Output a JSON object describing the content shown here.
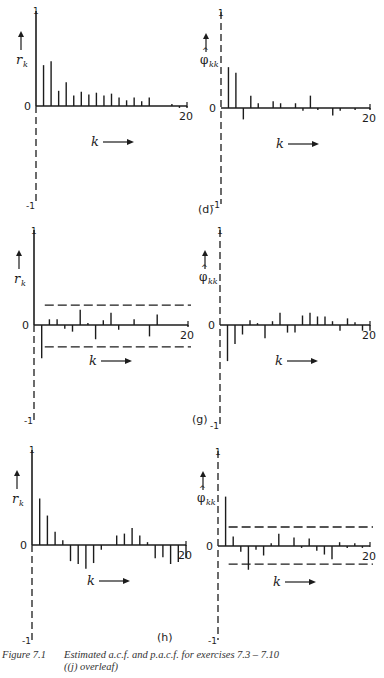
{
  "figure": {
    "label": "Figure 7.1",
    "caption_line1": "Estimated a.c.f. and p.a.c.f. for exercises 7.3 – 7.10",
    "caption_line2": "((j) overleaf)"
  },
  "chart_data": [
    {
      "id": "d-acf",
      "panel": "(d)",
      "type": "bar",
      "ylabel": "r_k",
      "xlabel": "k →",
      "ylim": [
        -1,
        1
      ],
      "xlim": [
        0,
        20
      ],
      "x_tick_labels": [
        "0",
        "20"
      ],
      "y_tick_labels": [
        "1",
        "0",
        "-1"
      ],
      "confidence_band": null,
      "x": [
        0,
        1,
        2,
        3,
        4,
        5,
        6,
        7,
        8,
        9,
        10,
        11,
        12,
        13,
        14,
        15,
        16,
        17,
        18,
        19,
        20
      ],
      "values": [
        1.0,
        0.43,
        0.47,
        0.16,
        0.25,
        0.11,
        0.15,
        0.12,
        0.14,
        0.11,
        0.13,
        0.09,
        0.06,
        0.09,
        0.05,
        0.09,
        0.0,
        0.0,
        0.02,
        -0.02,
        -0.02
      ]
    },
    {
      "id": "d-pacf",
      "panel": "(d)",
      "type": "bar",
      "ylabel": "φ̂_kk",
      "xlabel": "k →",
      "ylim": [
        -1,
        1
      ],
      "xlim": [
        0,
        20
      ],
      "x_tick_labels": [
        "0",
        "20"
      ],
      "y_tick_labels": [
        "1",
        "0",
        "-1"
      ],
      "confidence_band": null,
      "x": [
        1,
        2,
        3,
        4,
        5,
        6,
        7,
        8,
        9,
        10,
        11,
        12,
        13,
        14,
        15,
        16,
        17,
        18,
        19,
        20
      ],
      "values": [
        0.43,
        0.37,
        -0.12,
        0.13,
        0.05,
        0.0,
        0.07,
        0.05,
        0.0,
        0.05,
        -0.03,
        0.13,
        -0.02,
        0.0,
        -0.08,
        -0.03,
        0.0,
        -0.02,
        0.0,
        -0.02
      ]
    },
    {
      "id": "g-acf",
      "panel": "(g)",
      "type": "bar",
      "ylabel": "r_k",
      "xlabel": "k →",
      "ylim": [
        -1,
        1
      ],
      "xlim": [
        0,
        20
      ],
      "x_tick_labels": [
        "0",
        "20"
      ],
      "y_tick_labels": [
        "1",
        "0",
        "-1"
      ],
      "confidence_band": [
        -0.23,
        0.21
      ],
      "x": [
        0,
        1,
        2,
        3,
        4,
        5,
        6,
        7,
        8,
        9,
        10,
        11,
        12,
        13,
        14,
        15,
        16,
        17,
        18,
        19,
        20
      ],
      "values": [
        1.0,
        -0.35,
        0.06,
        0.06,
        -0.04,
        -0.07,
        0.16,
        0.02,
        -0.15,
        0.05,
        0.13,
        -0.05,
        0.0,
        0.06,
        0.01,
        -0.12,
        0.11,
        0.0,
        0.0,
        0.0,
        -0.02
      ]
    },
    {
      "id": "g-pacf",
      "panel": "(g)",
      "type": "bar",
      "ylabel": "φ̂_kk",
      "xlabel": "k →",
      "ylim": [
        -1,
        1
      ],
      "xlim": [
        0,
        20
      ],
      "x_tick_labels": [
        "0",
        "20"
      ],
      "y_tick_labels": [
        "1",
        "0",
        "-1"
      ],
      "confidence_band": null,
      "x": [
        1,
        2,
        3,
        4,
        5,
        6,
        7,
        8,
        9,
        10,
        11,
        12,
        13,
        14,
        15,
        16,
        17,
        18,
        19,
        20
      ],
      "values": [
        -0.38,
        -0.2,
        -0.1,
        0.05,
        0.02,
        -0.14,
        0.04,
        0.13,
        -0.08,
        -0.08,
        0.1,
        0.13,
        0.09,
        0.09,
        0.04,
        -0.06,
        0.07,
        0.03,
        -0.06,
        -0.06
      ]
    },
    {
      "id": "h-acf",
      "panel": "(h)",
      "type": "bar",
      "ylabel": "r_k",
      "xlabel": "k →",
      "ylim": [
        -1,
        1
      ],
      "xlim": [
        0,
        20
      ],
      "x_tick_labels": [
        "0",
        "20"
      ],
      "y_tick_labels": [
        "1",
        "0",
        "-1"
      ],
      "confidence_band": null,
      "x": [
        0,
        1,
        2,
        3,
        4,
        5,
        6,
        7,
        8,
        9,
        10,
        11,
        12,
        13,
        14,
        15,
        16,
        17,
        18,
        19,
        20
      ],
      "values": [
        1.0,
        0.49,
        0.31,
        0.14,
        0.05,
        -0.17,
        -0.2,
        -0.25,
        -0.19,
        -0.05,
        0.01,
        0.1,
        0.12,
        0.18,
        0.1,
        0.03,
        -0.14,
        -0.13,
        -0.2,
        -0.18,
        -0.14
      ]
    },
    {
      "id": "h-pacf",
      "panel": "(h)",
      "type": "bar",
      "ylabel": "φ̂_kk",
      "xlabel": "k →",
      "ylim": [
        -1,
        1
      ],
      "xlim": [
        0,
        20
      ],
      "x_tick_labels": [
        "0",
        "20"
      ],
      "y_tick_labels": [
        "1",
        "0",
        "-1"
      ],
      "confidence_band": [
        -0.19,
        0.2
      ],
      "x": [
        1,
        2,
        3,
        4,
        5,
        6,
        7,
        8,
        9,
        10,
        11,
        12,
        13,
        14,
        15,
        16,
        17,
        18,
        19,
        20
      ],
      "values": [
        0.52,
        0.1,
        -0.06,
        -0.25,
        -0.04,
        -0.1,
        0.03,
        0.13,
        0.0,
        0.09,
        -0.02,
        0.08,
        -0.05,
        -0.09,
        -0.14,
        0.04,
        -0.02,
        0.03,
        -0.02,
        0.0
      ]
    }
  ],
  "layout": {
    "panels": [
      {
        "id": "d-acf",
        "x0": 36,
        "x20": 187,
        "y0": 106,
        "yscale": 95,
        "top": 10,
        "bottom": 205,
        "panel_label_pos": null
      },
      {
        "id": "d-pacf",
        "x0": 221,
        "x20": 370,
        "y0": 108,
        "yscale": 95,
        "top": 12,
        "bottom": 204,
        "panel_label_pos": [
          198,
          213
        ]
      },
      {
        "id": "g-acf",
        "x0": 34,
        "x20": 188,
        "y0": 325,
        "yscale": 95,
        "top": 230,
        "bottom": 420,
        "panel_label_pos": null
      },
      {
        "id": "g-pacf",
        "x0": 220,
        "x20": 370,
        "y0": 325,
        "yscale": 95,
        "top": 230,
        "bottom": 425,
        "panel_label_pos": [
          192,
          423
        ]
      },
      {
        "id": "h-acf",
        "x0": 32,
        "x20": 186,
        "y0": 545,
        "yscale": 95,
        "top": 449,
        "bottom": 640,
        "panel_label_pos": [
          157,
          641
        ]
      },
      {
        "id": "h-pacf",
        "x0": 218,
        "x20": 370,
        "y0": 546,
        "yscale": 95,
        "top": 451,
        "bottom": 640,
        "panel_label_pos": null
      }
    ]
  }
}
